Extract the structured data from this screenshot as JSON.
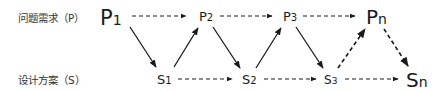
{
  "rows": {
    "problem_label": "问题需求（P）",
    "solution_label": "设计方案（S）"
  },
  "nodes": {
    "P1": {
      "base": "P",
      "sub": "1"
    },
    "P2": {
      "base": "P",
      "sub": "2"
    },
    "P3": {
      "base": "P",
      "sub": "3"
    },
    "Pn": {
      "base": "P",
      "sub": "n"
    },
    "S1": {
      "base": "S",
      "sub": "1"
    },
    "S2": {
      "base": "S",
      "sub": "2"
    },
    "S3": {
      "base": "S",
      "sub": "3"
    },
    "Sn": {
      "base": "S",
      "sub": "n"
    }
  },
  "edges": [
    {
      "from": "P1",
      "to": "P2",
      "style": "dashed"
    },
    {
      "from": "P2",
      "to": "P3",
      "style": "dashed"
    },
    {
      "from": "P3",
      "to": "Pn",
      "style": "dashed"
    },
    {
      "from": "S1",
      "to": "S2",
      "style": "dashed"
    },
    {
      "from": "S2",
      "to": "S3",
      "style": "dashed"
    },
    {
      "from": "S3",
      "to": "Sn",
      "style": "dashed"
    },
    {
      "from": "P1",
      "to": "S1",
      "style": "solid"
    },
    {
      "from": "S1",
      "to": "P2",
      "style": "solid"
    },
    {
      "from": "P2",
      "to": "S2",
      "style": "solid"
    },
    {
      "from": "S2",
      "to": "P3",
      "style": "solid"
    },
    {
      "from": "P3",
      "to": "S3",
      "style": "solid"
    },
    {
      "from": "S3",
      "to": "Pn",
      "style": "bold-dashed"
    },
    {
      "from": "Pn",
      "to": "Sn",
      "style": "bold-dashed"
    }
  ],
  "colors": {
    "stroke": "#1a1a1a",
    "text": "#1a1a1a"
  }
}
